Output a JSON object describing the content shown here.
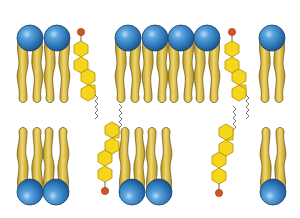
{
  "diagram": {
    "colors": {
      "background": "#ffffff",
      "head_light": "#8fc3ea",
      "head_mid": "#3a86c4",
      "head_dark": "#1d5a93",
      "head_stroke": "#1b3f66",
      "tail_light": "#f2dc7a",
      "tail_mid": "#d9b637",
      "tail_dark": "#a07f14",
      "tail_stroke": "#6e5a1e",
      "ring_fill": "#f6d61c",
      "ring_stroke": "#b38f00",
      "hydroxyl": "#d9531e",
      "chain": "#555555"
    },
    "top_leaflet": {
      "phospholipid_heads_x": [
        30,
        57,
        128,
        155,
        181,
        207,
        272
      ],
      "head_y": 38,
      "cholesterol": [
        {
          "x": 81,
          "y": 32
        },
        {
          "x": 232,
          "y": 32
        }
      ]
    },
    "bottom_leaflet": {
      "phospholipid_heads_x": [
        30,
        56,
        132,
        159,
        273
      ],
      "head_y": 192,
      "cholesterol": [
        {
          "x": 105,
          "y": 191
        },
        {
          "x": 219,
          "y": 193
        }
      ]
    }
  }
}
